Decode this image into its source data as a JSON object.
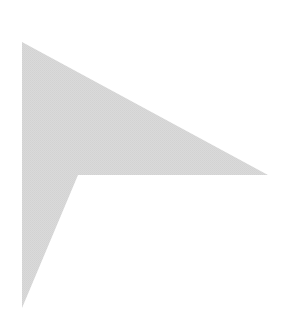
{
  "shape": {
    "name": "arrowhead-right",
    "fill": "#d8d8d8",
    "background": "#ffffff",
    "points": "22,42 268,175 78,175 22,308"
  }
}
